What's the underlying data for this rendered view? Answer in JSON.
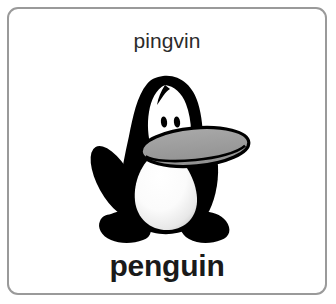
{
  "card": {
    "word_top": "pingvin",
    "word_bottom": "penguin",
    "illustration": "penguin-illustration",
    "colors": {
      "border": "#9a9a9a",
      "card_background": "#ffffff",
      "page_background": "#ffffff",
      "text_top": "#2b2b2b",
      "text_bottom": "#1a1a1a",
      "penguin_body": "#000000",
      "penguin_belly": "#ffffff",
      "penguin_belly_shadow": "#d6d6d6",
      "penguin_beak": "#9a9a9a",
      "penguin_beak_outline": "#000000",
      "penguin_eye": "#000000"
    }
  },
  "illustration_parts": {
    "head_cap": "head-cap",
    "forehead": "forehead-patch",
    "eye_left": "eye-left",
    "eye_right": "eye-right",
    "beak": "beak",
    "flipper_left": "flipper-left",
    "flipper_right": "flipper-right",
    "belly": "belly",
    "foot_left": "foot-left",
    "foot_right": "foot-right"
  }
}
